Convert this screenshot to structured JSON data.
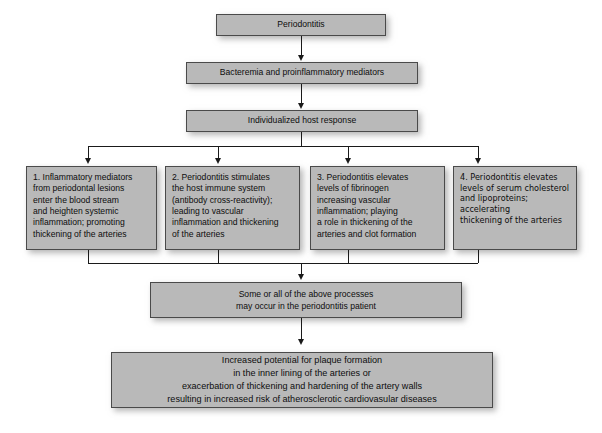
{
  "diagram": {
    "background_color": "#ffffff",
    "box_fill_color": "#b9b9b9",
    "box_border_color": "#4a4a4a",
    "connector_color": "#1a1a1a",
    "nodes": {
      "periodontitis": "Periodontitis",
      "bacteremia": "Bacteremia and proinflammatory mediators",
      "host_response": "Individualized host response",
      "mechanism_1": "1. Inflammatory mediators\nfrom periodontal lesions\nenter the blood stream\nand heighten systemic\ninflammation; promoting\nthickening of the arteries",
      "mechanism_2": "2. Periodontitis stimulates\nthe host immune system\n(antibody cross-reactivity);\nleading to vascular\ninflammation and thickening\nof the arteries",
      "mechanism_3": "3. Periodontitis elevates\nlevels of fibrinogen\nincreasing vascular\ninflammation; playing\na role in thickening of the\narteries and clot formation",
      "mechanism_4": "4. Periodontitis elevates\nlevels of serum cholesterol\nand lipoproteins;\naccelerating\nthickening of the arteries",
      "some_or_all": "Some or all of the above processes\nmay occur in the periodontitis patient",
      "outcome": "Increased potential for plaque formation\nin the inner lining of the arteries or\nexacerbation of thickening and hardening of the artery walls\nresulting in increased risk of atherosclerotic cardiovasular diseases"
    }
  }
}
